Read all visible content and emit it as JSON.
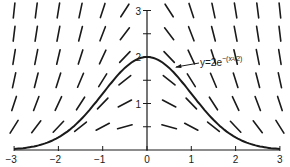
{
  "figure": {
    "type": "slope_field",
    "differential_equation": "dy/dx = -x*y",
    "curve_label": {
      "prefix": "y=2e",
      "exponent": "−(x²/2)",
      "full": "y=2e^-(x^2/2)"
    },
    "x_axis": {
      "ticks": [
        "−3",
        "−2",
        "−1",
        "0",
        "1",
        "2",
        "3"
      ],
      "range": [
        -3,
        3
      ]
    },
    "y_axis": {
      "ticks": [
        "1",
        "2",
        "3"
      ],
      "minor_ticks": [
        0.5,
        1.5,
        2.5
      ],
      "range": [
        0,
        3
      ]
    },
    "slope_grid": {
      "x_values": [
        -3,
        -2.5,
        -2,
        -1.5,
        -1,
        -0.5,
        0.5,
        1,
        1.5,
        2,
        2.5,
        3
      ],
      "y_values": [
        0.5,
        1,
        1.5,
        2,
        2.5,
        3
      ]
    },
    "colors": {
      "ink": "#1a1a1a",
      "background": "#ffffff"
    }
  },
  "chart_data": {
    "type": "line",
    "title": "",
    "xlabel": "",
    "ylabel": "",
    "xlim": [
      -3,
      3
    ],
    "ylim": [
      0,
      3
    ],
    "x_ticks": [
      -3,
      -2,
      -1,
      0,
      1,
      2,
      3
    ],
    "y_ticks": [
      1,
      2,
      3
    ],
    "grid": false,
    "series": [
      {
        "name": "y=2e^-(x^2/2)",
        "x": [
          -3,
          -2.5,
          -2,
          -1.5,
          -1,
          -0.5,
          0,
          0.5,
          1,
          1.5,
          2,
          2.5,
          3
        ],
        "values": [
          0.022,
          0.088,
          0.271,
          0.649,
          1.213,
          1.765,
          2.0,
          1.765,
          1.213,
          0.649,
          0.271,
          0.088,
          0.022
        ]
      }
    ],
    "annotations": [
      "slope field for dy/dx = -xy",
      "y=2e^-(x^2/2)"
    ]
  }
}
